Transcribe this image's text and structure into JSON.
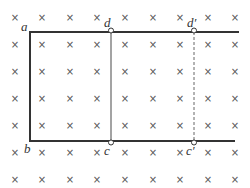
{
  "diagram": {
    "field": {
      "symbol": "×",
      "meaning": "magnetic field into page",
      "columns_x": [
        15,
        42,
        70,
        97,
        125,
        153,
        180,
        208,
        235
      ],
      "rows_y": [
        17,
        44,
        71,
        98,
        125,
        152,
        179
      ],
      "color": "#555555"
    },
    "frame": {
      "color": "#333333",
      "top_rail": {
        "x1": 30,
        "x2": 239,
        "y": 32
      },
      "bottom_rail": {
        "x1": 30,
        "x2": 235,
        "y": 141
      },
      "left_side": {
        "x": 30,
        "y1": 32,
        "y2": 141
      }
    },
    "rod_dc": {
      "x": 111,
      "y1": 32,
      "y2": 141,
      "color": "#666666",
      "style": "solid"
    },
    "rod_dc_prime": {
      "x": 194,
      "y1": 32,
      "y2": 141,
      "color": "#666666",
      "style": "dashed"
    },
    "labels": {
      "a": "a",
      "b": "b",
      "c": "c",
      "d": "d",
      "c_prime": "c′",
      "d_prime": "d′"
    }
  }
}
